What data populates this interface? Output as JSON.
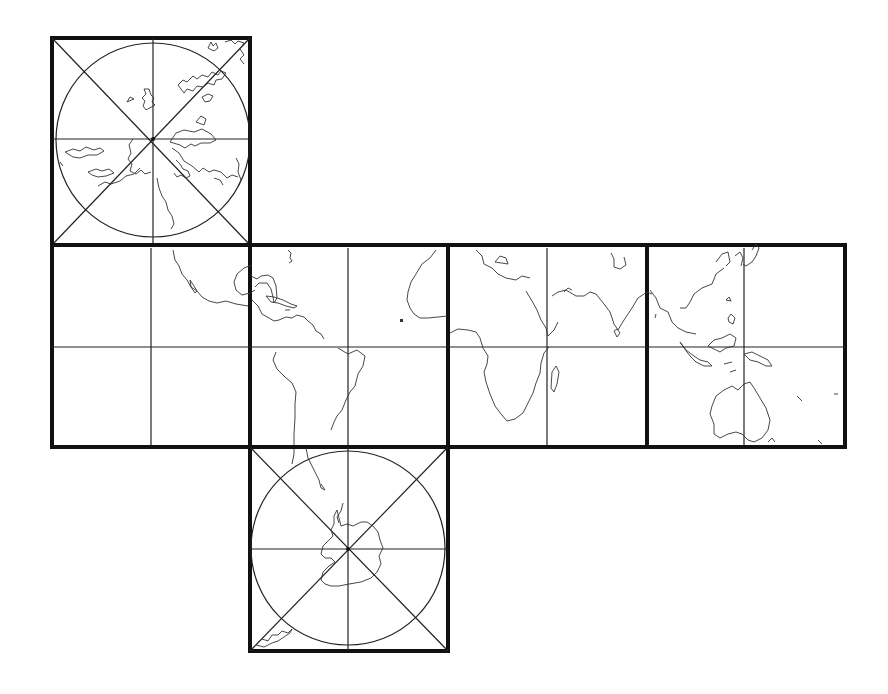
{
  "map": {
    "type": "cube-projection-net",
    "colors": {
      "background": "#ffffff",
      "frame": "#111111",
      "grid": "#222222",
      "coast": "#333333"
    },
    "face_size": 198,
    "faces": [
      {
        "id": "north-polar",
        "x": 52,
        "y": 38,
        "circle": true,
        "diagonals": true
      },
      {
        "id": "pacific",
        "x": 52,
        "y": 245,
        "circle": false,
        "diagonals": false
      },
      {
        "id": "americas",
        "x": 250,
        "y": 245,
        "circle": false,
        "diagonals": false
      },
      {
        "id": "africa",
        "x": 448,
        "y": 245,
        "circle": false,
        "diagonals": false
      },
      {
        "id": "asia-oceania",
        "x": 647,
        "y": 245,
        "circle": false,
        "diagonals": false
      },
      {
        "id": "south-polar",
        "x": 250,
        "y": 447,
        "circle": true,
        "diagonals": true
      }
    ]
  }
}
